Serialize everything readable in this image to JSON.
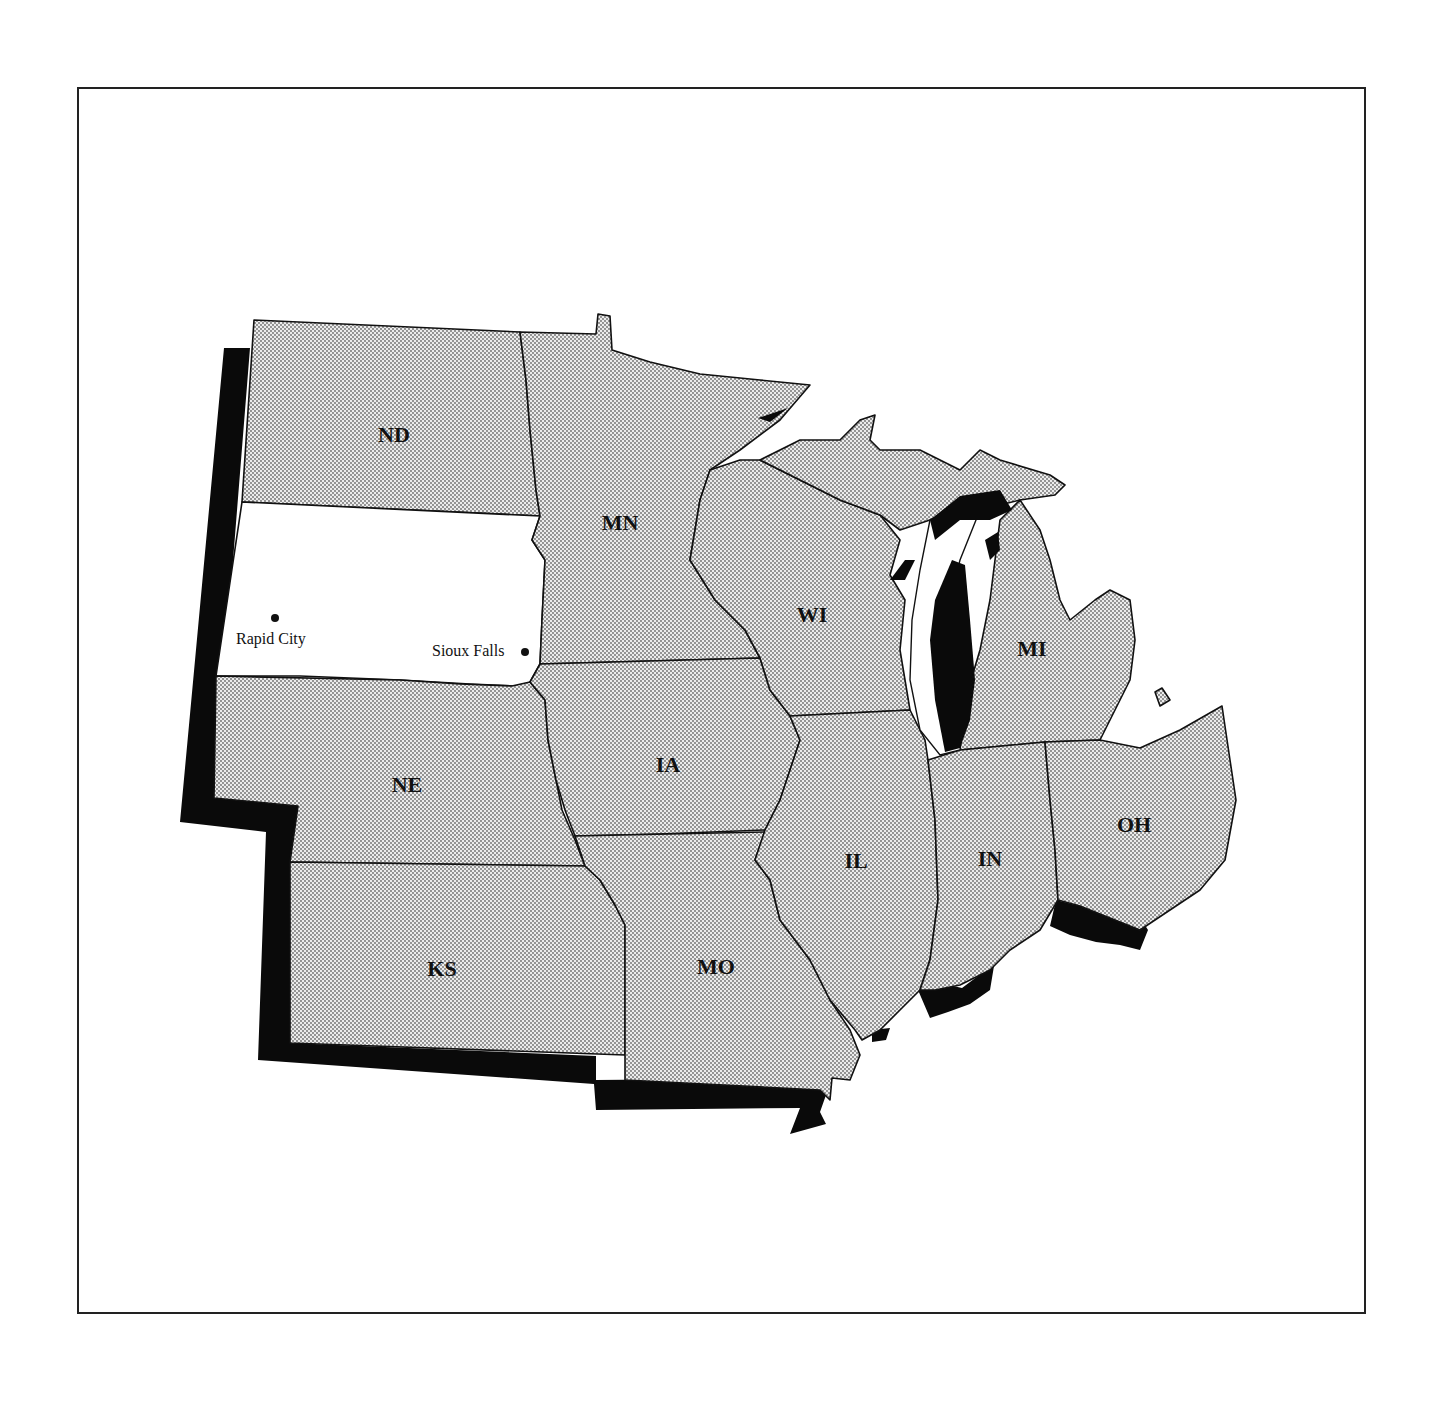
{
  "map": {
    "title": "",
    "highlighted_state": "SD",
    "states": [
      {
        "abbr": "ND",
        "label": "ND"
      },
      {
        "abbr": "MN",
        "label": "MN"
      },
      {
        "abbr": "WI",
        "label": "WI"
      },
      {
        "abbr": "MI",
        "label": "MI"
      },
      {
        "abbr": "NE",
        "label": "NE"
      },
      {
        "abbr": "IA",
        "label": "IA"
      },
      {
        "abbr": "IL",
        "label": "IL"
      },
      {
        "abbr": "IN",
        "label": "IN"
      },
      {
        "abbr": "OH",
        "label": "OH"
      },
      {
        "abbr": "KS",
        "label": "KS"
      },
      {
        "abbr": "MO",
        "label": "MO"
      }
    ],
    "cities": [
      {
        "name": "Rapid City"
      },
      {
        "name": "Sioux Falls"
      }
    ],
    "colors": {
      "state_fill": "stipple-gray",
      "highlight_fill": "#ffffff",
      "shadow": "#0a0a0a",
      "border": "#111111"
    }
  }
}
